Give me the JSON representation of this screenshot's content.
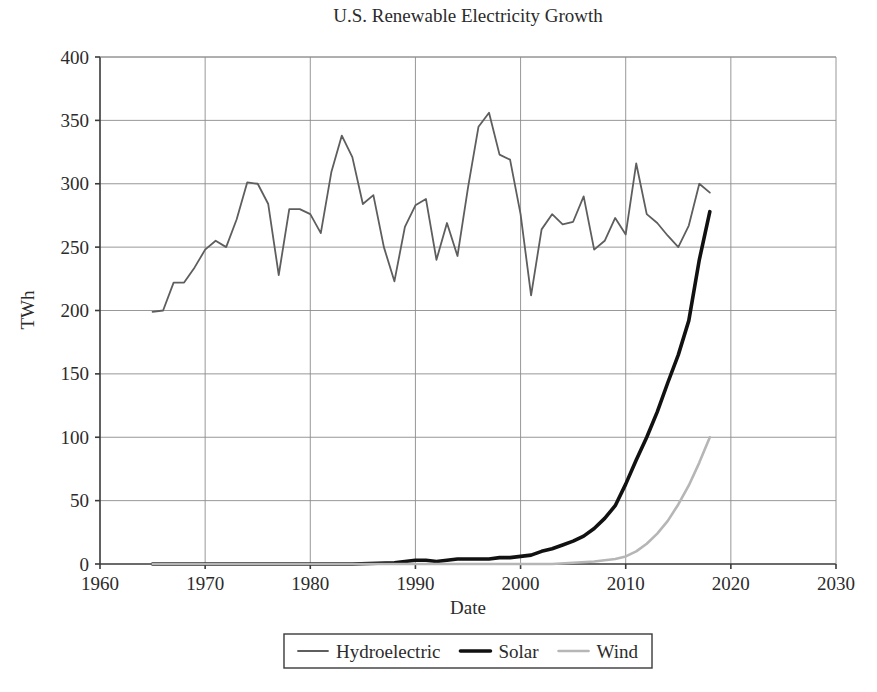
{
  "chart_data": {
    "type": "line",
    "title": "U.S. Renewable Electricity Growth",
    "xlabel": "Date",
    "ylabel": "TWh",
    "xlim": [
      1960,
      2030
    ],
    "ylim": [
      0,
      400
    ],
    "xticks": [
      1960,
      1970,
      1980,
      1990,
      2000,
      2010,
      2020,
      2030
    ],
    "xticklabels": [
      "1960",
      "1970",
      "1980",
      "1990",
      "2000",
      "2010",
      "2020",
      "2030"
    ],
    "yticks": [
      0,
      50,
      100,
      150,
      200,
      250,
      300,
      350,
      400
    ],
    "yticklabels": [
      "0",
      "50",
      "100",
      "150",
      "200",
      "250",
      "300",
      "350",
      "400"
    ],
    "grid": true,
    "legend_position": "below-axes",
    "series": [
      {
        "name": "Hydroelectric",
        "color": "#5e5e5e",
        "linewidth": 1.8,
        "x": [
          1965,
          1966,
          1967,
          1968,
          1969,
          1970,
          1971,
          1972,
          1973,
          1974,
          1975,
          1976,
          1977,
          1978,
          1979,
          1980,
          1981,
          1982,
          1983,
          1984,
          1985,
          1986,
          1987,
          1988,
          1989,
          1990,
          1991,
          1992,
          1993,
          1994,
          1995,
          1996,
          1997,
          1998,
          1999,
          2000,
          2001,
          2002,
          2003,
          2004,
          2005,
          2006,
          2007,
          2008,
          2009,
          2010,
          2011,
          2012,
          2013,
          2014,
          2015,
          2016,
          2017,
          2018
        ],
        "values": [
          199,
          200,
          222,
          222,
          234,
          248,
          255,
          250,
          272,
          301,
          300,
          284,
          228,
          280,
          280,
          276,
          261,
          309,
          338,
          321,
          284,
          291,
          250,
          223,
          266,
          283,
          288,
          240,
          269,
          243,
          297,
          345,
          356,
          323,
          319,
          276,
          212,
          264,
          276,
          268,
          270,
          290,
          248,
          255,
          273,
          260,
          316,
          276,
          269,
          259,
          250,
          267,
          300,
          293
        ]
      },
      {
        "name": "Solar",
        "color": "#111111",
        "linewidth": 3.6,
        "x": [
          1965,
          1970,
          1975,
          1980,
          1984,
          1988,
          1989,
          1990,
          1991,
          1992,
          1993,
          1994,
          1995,
          1996,
          1997,
          1998,
          1999,
          2000,
          2001,
          2002,
          2003,
          2004,
          2005,
          2006,
          2007,
          2008,
          2009,
          2010,
          2011,
          2012,
          2013,
          2014,
          2015,
          2016,
          2017,
          2018
        ],
        "values": [
          0,
          0,
          0,
          0,
          0,
          1,
          2,
          3,
          3,
          2,
          3,
          4,
          4,
          4,
          4,
          5,
          5,
          6,
          7,
          10,
          12,
          15,
          18,
          22,
          28,
          36,
          46,
          63,
          82,
          100,
          120,
          143,
          165,
          192,
          240,
          278
        ]
      },
      {
        "name": "Wind",
        "color": "#b6b6b6",
        "linewidth": 2.6,
        "x": [
          1965,
          1980,
          1990,
          1995,
          2000,
          2003,
          2005,
          2007,
          2008,
          2009,
          2010,
          2011,
          2012,
          2013,
          2014,
          2015,
          2016,
          2017,
          2018
        ],
        "values": [
          0,
          0,
          0,
          0,
          0,
          0,
          1,
          2,
          3,
          4,
          6,
          10,
          16,
          24,
          34,
          47,
          62,
          80,
          100
        ]
      }
    ]
  },
  "legend": {
    "entries": [
      {
        "label": "Hydroelectric"
      },
      {
        "label": "Solar"
      },
      {
        "label": "Wind"
      }
    ]
  },
  "colors": {
    "background": "#ffffff",
    "grid": "#8c8c8c",
    "spine": "#3a3a3a",
    "text": "#2b2b2b"
  }
}
